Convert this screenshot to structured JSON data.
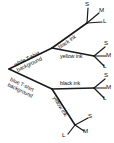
{
  "diagram": {
    "type": "tree-diagram",
    "line_color": "#1a1a1a",
    "background_color": "#ffffff",
    "root": {
      "children": [
        {
          "label_line1": "white T-shirt",
          "label_line2": "background",
          "children": [
            {
              "label": "black ink",
              "leaves": [
                "S",
                "M",
                "L"
              ]
            },
            {
              "label": "yellow ink",
              "leaves": [
                "S",
                "M",
                "L"
              ]
            }
          ]
        },
        {
          "label_line1": "blue T-shirt",
          "label_line2": "background",
          "children": [
            {
              "label": "black ink",
              "leaves": [
                "S",
                "M",
                "L"
              ]
            },
            {
              "label": "yellow ink",
              "leaves": [
                "S",
                "M",
                "L"
              ]
            }
          ]
        }
      ]
    },
    "branch_labels": {
      "white_bg_line1": "white T-shirt",
      "white_bg_line2": "background",
      "blue_bg_line1": "blue T-shirt",
      "blue_bg_line2": "background",
      "white_black_ink": "black ink",
      "white_yellow_ink": "yellow ink",
      "blue_black_ink": "black ink",
      "blue_yellow_ink": "yellow ink"
    },
    "leaf_labels": {
      "g1_s": "S",
      "g1_m": "M",
      "g1_l": "L",
      "g2_s": "S",
      "g2_m": "M",
      "g2_l": "L",
      "g3_s": "S",
      "g3_m": "M",
      "g3_l": "L",
      "g4_s": "S",
      "g4_m": "M",
      "g4_l": "L"
    }
  }
}
